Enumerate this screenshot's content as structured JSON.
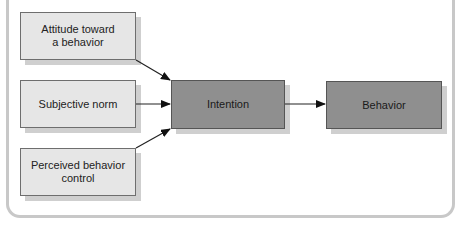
{
  "diagram": {
    "title": "",
    "nodes": [
      {
        "id": "attitude",
        "label": "Attitude toward\na behavior"
      },
      {
        "id": "subjective_norm",
        "label": "Subjective norm"
      },
      {
        "id": "perceived_control",
        "label": "Perceived behavior\ncontrol"
      },
      {
        "id": "intention",
        "label": "Intention"
      },
      {
        "id": "behavior",
        "label": "Behavior"
      }
    ],
    "edges": [
      {
        "from": "attitude",
        "to": "intention"
      },
      {
        "from": "subjective_norm",
        "to": "intention"
      },
      {
        "from": "perceived_control",
        "to": "intention"
      },
      {
        "from": "intention",
        "to": "behavior"
      }
    ],
    "colors": {
      "input_box_fill": "#e6e6e6",
      "process_box_fill": "#8f8f8f",
      "frame": "#c8c8c8",
      "shadow": "#cfcfcf"
    }
  }
}
